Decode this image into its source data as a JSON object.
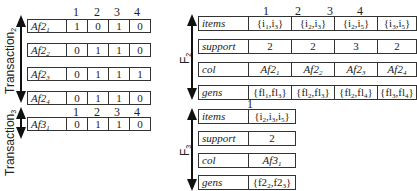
{
  "transaction2": {
    "axis_label": "Transaction",
    "axis_sub": "2",
    "column_headers": [
      "1",
      "2",
      "3",
      "4"
    ],
    "rows": [
      {
        "label": "Af2",
        "sub": "1",
        "values": [
          "1",
          "0",
          "1",
          "0"
        ]
      },
      {
        "label": "Af2",
        "sub": "2",
        "values": [
          "0",
          "1",
          "1",
          "0"
        ]
      },
      {
        "label": "Af2",
        "sub": "3",
        "values": [
          "0",
          "1",
          "1",
          "1"
        ]
      },
      {
        "label": "Af2",
        "sub": "4",
        "values": [
          "0",
          "1",
          "1",
          "0"
        ]
      }
    ]
  },
  "transaction3": {
    "axis_label": "Transaction",
    "axis_sub": "3",
    "column_headers": [
      "1",
      "2",
      "3",
      "4"
    ],
    "rows": [
      {
        "label": "Af3",
        "sub": "1",
        "values": [
          "0",
          "1",
          "1",
          "0"
        ]
      }
    ]
  },
  "f2": {
    "axis_label": "F",
    "axis_sub": "2",
    "column_headers": [
      "1",
      "2",
      "3",
      "4"
    ],
    "rows": [
      {
        "label": "items",
        "values": [
          "{i1,i3}",
          "{i2,i3}",
          "{i2,i5}",
          "{i3,i5}"
        ]
      },
      {
        "label": "support",
        "values": [
          "2",
          "2",
          "3",
          "2"
        ]
      },
      {
        "label": "col",
        "values": [
          "Af21",
          "Af22",
          "Af23",
          "Af24"
        ]
      },
      {
        "label": "gens",
        "values": [
          "{fl1,fl3}",
          "{fl2,fl3}",
          "{fl2,fl4}",
          "{fl3,fl4}"
        ]
      }
    ]
  },
  "f3": {
    "axis_label": "F",
    "axis_sub": "3",
    "column_headers": [
      "1"
    ],
    "rows": [
      {
        "label": "items",
        "values": [
          "{i2,i3,i5}"
        ]
      },
      {
        "label": "support",
        "values": [
          "2"
        ]
      },
      {
        "label": "col",
        "values": [
          "Af31"
        ]
      },
      {
        "label": "gens",
        "values": [
          "{f22,f23}"
        ]
      }
    ]
  }
}
